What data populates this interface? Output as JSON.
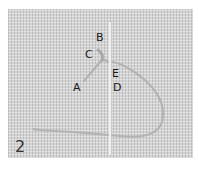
{
  "figure": {
    "step_number": "2",
    "point_labels": {
      "A": "A",
      "B": "B",
      "C": "C",
      "D": "D",
      "E": "E"
    },
    "colors": {
      "fabric": "#d4d4d4",
      "thread": "#b5b5b5",
      "needle": "#eeeeee",
      "label": "#1a1a1a"
    }
  }
}
